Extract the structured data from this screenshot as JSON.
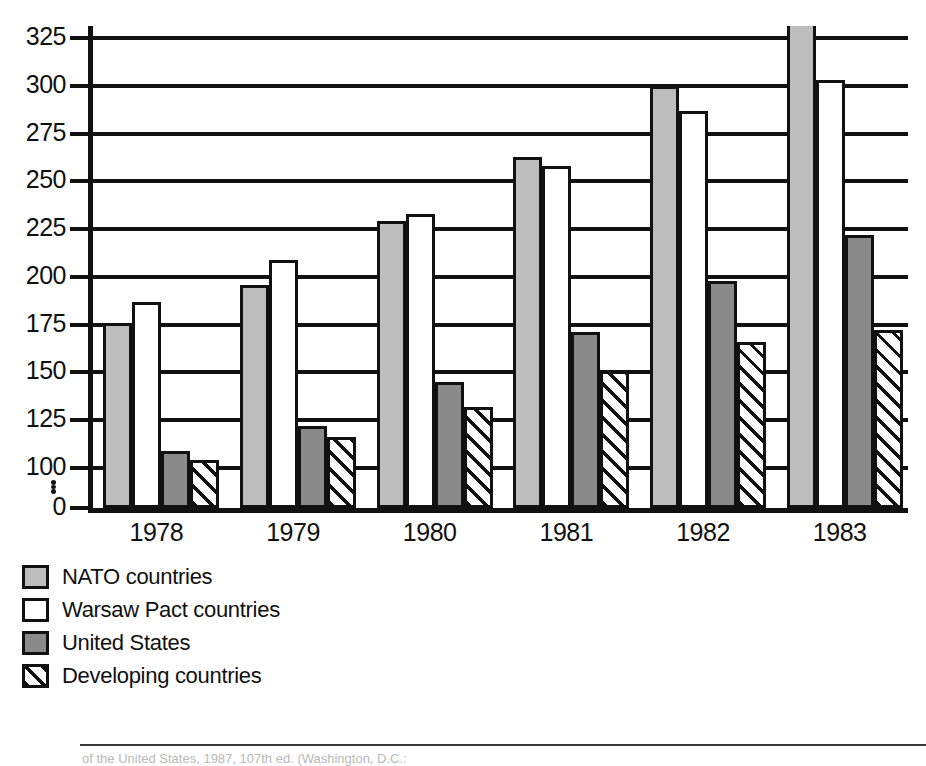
{
  "chart_data": {
    "type": "bar",
    "title": "",
    "subtitle": "",
    "xlabel": "",
    "ylabel": "",
    "categories": [
      "1978",
      "1979",
      "1980",
      "1981",
      "1982",
      "1983"
    ],
    "series": [
      {
        "name": "NATO countries",
        "key": "nato",
        "swatch": "light-gray",
        "color": "#bdbdbd",
        "values": [
          176,
          196,
          229,
          263,
          300,
          332
        ]
      },
      {
        "name": "Warsaw Pact countries",
        "key": "warsaw",
        "swatch": "white",
        "color": "#ffffff",
        "values": [
          187,
          209,
          233,
          258,
          287,
          303
        ]
      },
      {
        "name": "United States",
        "key": "us",
        "swatch": "dark-gray",
        "color": "#8a8a8a",
        "values": [
          109,
          122,
          145,
          171,
          198,
          222
        ]
      },
      {
        "name": "Developing countries",
        "key": "dev",
        "swatch": "hatched",
        "color": "#ffffff",
        "values": [
          104,
          116,
          132,
          151,
          166,
          172
        ]
      }
    ],
    "yticks": [
      0,
      100,
      125,
      150,
      175,
      200,
      225,
      250,
      275,
      300,
      325
    ],
    "ylim": [
      0,
      325
    ],
    "y_axis_break": true,
    "y_axis_break_between": [
      0,
      100
    ],
    "grid": true,
    "gridlines_at": [
      100,
      125,
      150,
      175,
      200,
      225,
      250,
      275,
      300,
      325
    ],
    "legend_position": "below-left"
  },
  "axis": {
    "y_tick_labels": [
      "325",
      "300",
      "275",
      "250",
      "225",
      "200",
      "175",
      "150",
      "125",
      "100",
      "0"
    ],
    "x_tick_labels": [
      "1978",
      "1979",
      "1980",
      "1981",
      "1982",
      "1983"
    ]
  },
  "legend": {
    "items": [
      {
        "label": "NATO countries"
      },
      {
        "label": "Warsaw Pact countries"
      },
      {
        "label": "United States"
      },
      {
        "label": "Developing countries"
      }
    ]
  },
  "caption": {
    "text": "of the United States, 1987, 107th ed. (Washington, D.C.:"
  },
  "colors": {
    "nato": "#bdbdbd",
    "warsaw": "#ffffff",
    "united_states": "#8a8a8a",
    "developing": "#ffffff",
    "ink": "#111111"
  }
}
